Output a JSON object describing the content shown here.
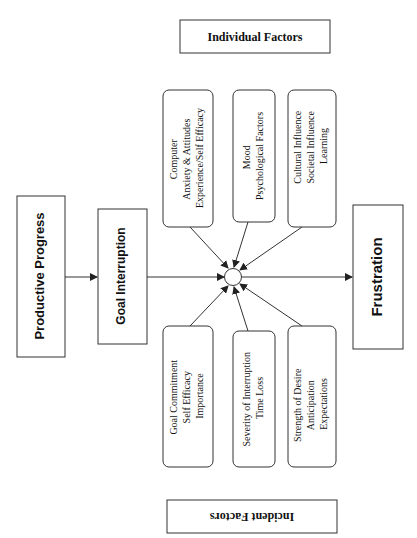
{
  "diagram": {
    "title_top": "Individual Factors",
    "title_bottom": "Incident Factors",
    "flow": {
      "start": "Productive Progress",
      "interrupt": "Goal Interruption",
      "end": "Frustration"
    },
    "individual_factors": [
      {
        "lines": [
          "Computer",
          "Anxiety & Attitudes",
          "Experience/Self Efficacy"
        ]
      },
      {
        "lines": [
          "Mood",
          "Psychological Factors"
        ]
      },
      {
        "lines": [
          "Cultural Influence",
          "Societal Influence",
          "Learning"
        ]
      }
    ],
    "incident_factors": [
      {
        "lines": [
          "Goal  Commitment",
          "Self Efficacy",
          "Importance"
        ]
      },
      {
        "lines": [
          "Severity of Interruption",
          "Time Loss"
        ]
      },
      {
        "lines": [
          "Strength of Desire",
          "Anticipation",
          "Expectations"
        ]
      }
    ],
    "colors": {
      "stroke": "#333333",
      "text": "#111111",
      "background": "#ffffff"
    }
  }
}
